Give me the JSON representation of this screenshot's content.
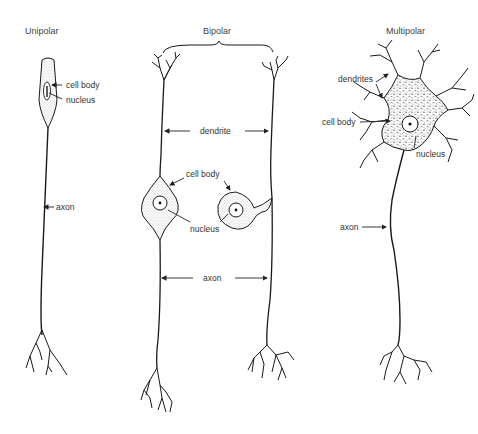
{
  "diagram": {
    "type": "neuron-types",
    "panels": [
      {
        "id": "unipolar",
        "title": "Unipolar",
        "labels": {
          "cell_body": "cell body",
          "nucleus": "nucleus",
          "axon": "axon"
        }
      },
      {
        "id": "bipolar",
        "title": "Bipolar",
        "labels": {
          "dendrite": "dendrite",
          "cell_body": "cell body",
          "nucleus": "nucleus",
          "axon": "axon"
        }
      },
      {
        "id": "multipolar",
        "title": "Multipolar",
        "labels": {
          "dendrites": "dendrites",
          "cell_body": "cell body",
          "nucleus": "nucleus",
          "axon": "axon"
        }
      }
    ]
  },
  "colors": {
    "ink": "#1a1a1a",
    "stipple": "#888888",
    "text": "#333333",
    "background": "#ffffff"
  }
}
